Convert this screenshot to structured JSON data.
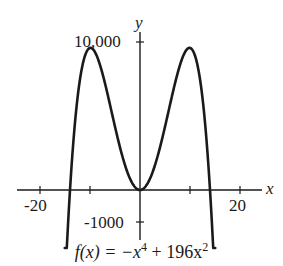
{
  "chart_data": {
    "type": "line",
    "function": "-x^4 + 196x^2",
    "xlabel": "x",
    "ylabel": "y",
    "x_ticks": [
      -20,
      -10,
      10,
      20
    ],
    "x_tick_labels": [
      "-20",
      "20"
    ],
    "y_tick_labels": [
      "10,000",
      "-1000"
    ],
    "xlim": [
      -20,
      20
    ],
    "ylim": [
      -1000,
      10000
    ],
    "grid": false,
    "key_points": [
      {
        "x": -14,
        "y": 0
      },
      {
        "x": -9.9,
        "y": 9604
      },
      {
        "x": 0,
        "y": 0
      },
      {
        "x": 9.9,
        "y": 9604
      },
      {
        "x": 14,
        "y": 0
      }
    ]
  },
  "labels": {
    "y_axis": "y",
    "x_axis": "x",
    "y_top": "10,000",
    "y_bottom": "-1000",
    "x_left": "-20",
    "x_right": "20",
    "caption_prefix": "f(x) = −x",
    "caption_exp1": "4",
    "caption_mid": " + 196x",
    "caption_exp2": "2"
  },
  "colors": {
    "stroke": "#1a1a1a",
    "background": "#ffffff"
  }
}
